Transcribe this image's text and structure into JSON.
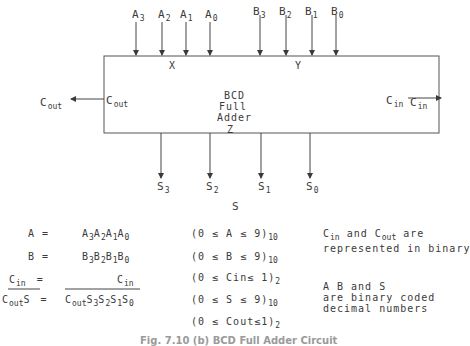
{
  "block": {
    "title_line1": "BCD",
    "title_line2": "Full",
    "title_line3": "Adder",
    "port_x": "X",
    "port_y": "Y",
    "port_z": "Z",
    "port_cout": "C",
    "port_cout_sub": "out",
    "port_cin": "C",
    "port_cin_sub": "in"
  },
  "inputs_a": [
    {
      "base": "A",
      "sub": "3"
    },
    {
      "base": "A",
      "sub": "2"
    },
    {
      "base": "A",
      "sub": "1"
    },
    {
      "base": "A",
      "sub": "0"
    }
  ],
  "inputs_b": [
    {
      "base": "B",
      "sub": "3"
    },
    {
      "base": "B",
      "sub": "2"
    },
    {
      "base": "B",
      "sub": "1"
    },
    {
      "base": "B",
      "sub": "0"
    }
  ],
  "outputs_s": [
    {
      "base": "S",
      "sub": "3"
    },
    {
      "base": "S",
      "sub": "2"
    },
    {
      "base": "S",
      "sub": "1"
    },
    {
      "base": "S",
      "sub": "0"
    }
  ],
  "output_s_label": "S",
  "external": {
    "cout": "C",
    "cout_sub": "out",
    "cin": "C",
    "cin_sub": "in"
  },
  "equations": {
    "a_lhs": "A  =",
    "a_rhs": "A3A2A1A0",
    "b_lhs": "B  =",
    "b_rhs": "B3B2B1B0",
    "cin_lhs": "Cin =",
    "cin_rhs": "Cin",
    "cs_lhs": "CoutS =",
    "cs_rhs": "CoutS3S2S1S0"
  },
  "ranges": [
    {
      "text": "(0 ≤ A ≤ 9)",
      "base": "10"
    },
    {
      "text": "(0 ≤ B ≤ 9)",
      "base": "10"
    },
    {
      "text": "(0 ≤ Cin≤ 1)",
      "base": "2"
    },
    {
      "text": "(0 ≤ S ≤ 9)",
      "base": "10"
    },
    {
      "text": "(0 ≤ Cout≤1)",
      "base": "2"
    }
  ],
  "notes": {
    "note1_line1": "Cin and Cout are",
    "note1_line2": "represented in binary",
    "note2_line1": "A  B and S",
    "note2_line2": "are binary coded",
    "note2_line3": "decimal numbers"
  },
  "caption": "Fig. 7.10  (b)  BCD Full Adder Circuit"
}
